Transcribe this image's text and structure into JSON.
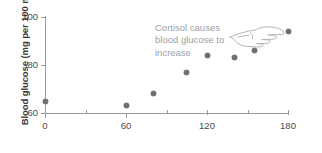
{
  "chart_data": {
    "type": "scatter",
    "title": "",
    "xlabel": "",
    "ylabel": "Blood glucose (mg per 100 ml)",
    "xlim": [
      0,
      180
    ],
    "ylim": [
      60,
      100
    ],
    "xticks": [
      0,
      60,
      120,
      180
    ],
    "xtick_labels": [
      "0",
      "60",
      "120",
      "180"
    ],
    "yticks": [
      60,
      80,
      100
    ],
    "ytick_labels": [
      "60",
      "80",
      "100"
    ],
    "x_minor_ticks": [
      30,
      90,
      150
    ],
    "grid": false,
    "legend": null,
    "series": [
      {
        "name": "Blood glucose",
        "x": [
          0,
          60,
          80,
          105,
          120,
          140,
          155,
          180
        ],
        "y": [
          65,
          63,
          68,
          77,
          84,
          83,
          86,
          94
        ]
      }
    ],
    "annotations": [
      {
        "text": "Cortisol causes\nblood glucose to\nincrease",
        "icon": "pointing-hand-icon"
      }
    ]
  },
  "colors": {
    "point": "#6e6e6e",
    "axis": "#9a9a9a",
    "tick_text": "#4a4a4a",
    "axis_label": "#3b3b3b",
    "annotation_text": "#9aa0a6"
  }
}
